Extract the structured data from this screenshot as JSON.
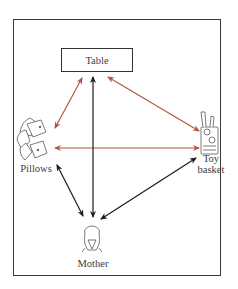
{
  "diagram": {
    "nodes": {
      "table": {
        "label": "Table"
      },
      "pillows": {
        "label": "Pillows"
      },
      "toy_basket": {
        "label_line1": "Toy",
        "label_line2": "basket"
      },
      "mother": {
        "label": "Mother"
      }
    },
    "edges": [
      {
        "from": "table",
        "to": "pillows",
        "direction": "both",
        "color": "#b5553f"
      },
      {
        "from": "table",
        "to": "toy_basket",
        "direction": "both",
        "color": "#b5553f"
      },
      {
        "from": "pillows",
        "to": "toy_basket",
        "direction": "both",
        "color": "#b5553f"
      },
      {
        "from": "mother",
        "to": "table",
        "direction": "both",
        "color": "#1a1a1a"
      },
      {
        "from": "pillows",
        "to": "mother",
        "direction": "both",
        "color": "#1a1a1a"
      },
      {
        "from": "toy_basket",
        "to": "mother",
        "direction": "both",
        "color": "#1a1a1a"
      }
    ],
    "colors": {
      "red_arrow": "#b5553f",
      "black_arrow": "#1a1a1a",
      "frame": "#3a3a3a"
    }
  }
}
